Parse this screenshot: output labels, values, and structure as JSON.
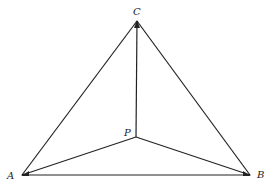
{
  "diagram": {
    "type": "triangle-with-interior-point",
    "stroke_color": "#222222",
    "points": {
      "A": {
        "label": "A",
        "x": 22,
        "y": 175
      },
      "B": {
        "label": "B",
        "x": 250,
        "y": 175
      },
      "C": {
        "label": "C",
        "x": 137,
        "y": 21
      },
      "P": {
        "label": "P",
        "x": 136,
        "y": 137
      }
    },
    "segments": [
      {
        "from": "A",
        "to": "B"
      },
      {
        "from": "B",
        "to": "C"
      },
      {
        "from": "C",
        "to": "A"
      },
      {
        "from": "P",
        "to": "A"
      },
      {
        "from": "P",
        "to": "B"
      },
      {
        "from": "P",
        "to": "C"
      }
    ],
    "labels": {
      "A": "A",
      "B": "B",
      "C": "C",
      "P": "P"
    }
  }
}
